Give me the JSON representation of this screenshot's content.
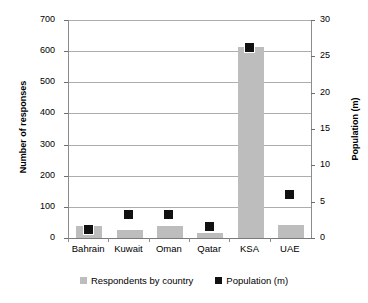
{
  "chart_data": {
    "type": "bar",
    "title": "",
    "xlabel": "",
    "ylabel": "Number of responses",
    "y2label": "Population (m)",
    "categories": [
      "Bahrain",
      "Kuwait",
      "Oman",
      "Qatar",
      "KSA",
      "UAE"
    ],
    "ylim": [
      0,
      700
    ],
    "y2lim": [
      0,
      30
    ],
    "yticks": [
      0,
      100,
      200,
      300,
      400,
      500,
      600,
      700
    ],
    "y2ticks": [
      0,
      5,
      10,
      15,
      20,
      25,
      30
    ],
    "grid": true,
    "legend_position": "bottom",
    "series": [
      {
        "name": "Respondents by country",
        "type": "bar",
        "axis": "left",
        "color": "#bdbdbd",
        "values": [
          38,
          25,
          40,
          17,
          613,
          41
        ]
      },
      {
        "name": "Population (m)",
        "type": "scatter",
        "axis": "right",
        "color": "#111111",
        "marker": "square",
        "values": [
          1.2,
          3.3,
          3.3,
          1.6,
          26.2,
          6.0
        ]
      }
    ]
  },
  "axes": {
    "left_title": "Number of responses",
    "right_title": "Population (m)",
    "left_ticks": [
      "0",
      "100",
      "200",
      "300",
      "400",
      "500",
      "600",
      "700"
    ],
    "right_ticks": [
      "0",
      "5",
      "10",
      "15",
      "20",
      "25",
      "30"
    ]
  },
  "legend": {
    "items": [
      {
        "label": "Respondents by country",
        "swatch": "bar-swatch-icon"
      },
      {
        "label": "Population (m)",
        "swatch": "marker-swatch-icon"
      }
    ]
  }
}
